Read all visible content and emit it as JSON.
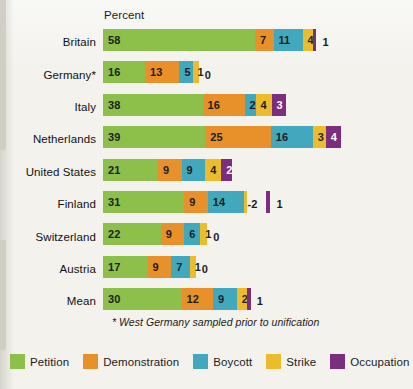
{
  "axis_title": "Percent",
  "footnote": "* West Germany sampled prior to unification",
  "colors": {
    "petition": "#8cc04a",
    "demonstration": "#e8912a",
    "boycott": "#42a8bd",
    "strike": "#ebbd2c",
    "occupation": "#7b2d7e",
    "background": "#f3f2ed",
    "text": "#1b1b1b"
  },
  "legend": [
    {
      "label": "Petition",
      "color": "#8cc04a",
      "key": "petition"
    },
    {
      "label": "Demonstration",
      "color": "#e8912a",
      "key": "demonstration"
    },
    {
      "label": "Boycott",
      "color": "#42a8bd",
      "key": "boycott"
    },
    {
      "label": "Strike",
      "color": "#ebbd2c",
      "key": "strike"
    },
    {
      "label": "Occupation",
      "color": "#7b2d7e",
      "key": "occupation"
    }
  ],
  "chart_data": {
    "type": "bar",
    "orientation": "horizontal",
    "stacked": true,
    "title": "",
    "xlabel": "Percent",
    "ylabel": "",
    "xlim": [
      0,
      90
    ],
    "grid": false,
    "legend_position": "bottom",
    "categories": [
      "Britain",
      "Germany*",
      "Italy",
      "Netherlands",
      "United States",
      "Finland",
      "Switzerland",
      "Austria",
      "Mean"
    ],
    "series": [
      {
        "name": "Petition",
        "color": "#8cc04a",
        "values": [
          58,
          16,
          38,
          39,
          21,
          31,
          22,
          17,
          30
        ]
      },
      {
        "name": "Demonstration",
        "color": "#e8912a",
        "values": [
          7,
          13,
          16,
          25,
          9,
          9,
          9,
          9,
          12
        ]
      },
      {
        "name": "Boycott",
        "color": "#42a8bd",
        "values": [
          11,
          5,
          2,
          16,
          9,
          14,
          6,
          7,
          9
        ]
      },
      {
        "name": "Strike",
        "color": "#ebbd2c",
        "values": [
          4,
          1,
          4,
          3,
          4,
          2,
          1,
          1,
          2
        ]
      },
      {
        "name": "Occupation",
        "color": "#7b2d7e",
        "values": [
          1,
          0,
          3,
          4,
          2,
          1,
          0,
          0,
          1
        ]
      }
    ],
    "annotations": [
      {
        "category": "Finland",
        "series": "Strike",
        "text": "-2",
        "style": "leader-dash"
      }
    ]
  },
  "rows": [
    {
      "label": "Britain",
      "segments": [
        {
          "key": "petition",
          "value": "58",
          "width": 152.0,
          "color": "#8cc04a",
          "label_inside": true
        },
        {
          "key": "demonstration",
          "value": "7",
          "width": 18.5,
          "color": "#e8912a",
          "label_inside": true
        },
        {
          "key": "boycott",
          "value": "11",
          "width": 29.0,
          "color": "#42a8bd",
          "label_inside": true
        },
        {
          "key": "strike",
          "value": "4",
          "width": 10.6,
          "color": "#ebbd2c",
          "label_inside": true
        },
        {
          "key": "occupation",
          "value": "1",
          "width": 3.4,
          "color": "#7b2d7e",
          "label_inside": false
        }
      ],
      "outer_value": "1"
    },
    {
      "label": "Germany*",
      "segments": [
        {
          "key": "petition",
          "value": "16",
          "width": 42.0,
          "color": "#8cc04a",
          "label_inside": true
        },
        {
          "key": "demonstration",
          "value": "13",
          "width": 34.4,
          "color": "#e8912a",
          "label_inside": true
        },
        {
          "key": "boycott",
          "value": "5",
          "width": 13.2,
          "color": "#42a8bd",
          "label_inside": true
        },
        {
          "key": "strike",
          "value": "1",
          "width": 6.2,
          "color": "#ebbd2c",
          "label_inside": true
        },
        {
          "key": "occupation",
          "value": "0",
          "width": 0,
          "color": "#7b2d7e",
          "label_inside": false
        }
      ],
      "outer_value": "0"
    },
    {
      "label": "Italy",
      "segments": [
        {
          "key": "petition",
          "value": "38",
          "width": 99.6,
          "color": "#8cc04a",
          "label_inside": true
        },
        {
          "key": "demonstration",
          "value": "16",
          "width": 42.0,
          "color": "#e8912a",
          "label_inside": true
        },
        {
          "key": "boycott",
          "value": "2",
          "width": 11.0,
          "color": "#42a8bd",
          "label_inside": true
        },
        {
          "key": "strike",
          "value": "4",
          "width": 16.0,
          "color": "#ebbd2c",
          "label_inside": true
        },
        {
          "key": "occupation",
          "value": "3",
          "width": 14.0,
          "color": "#7b2d7e",
          "label_inside": true
        }
      ],
      "outer_value": ""
    },
    {
      "label": "Netherlands",
      "segments": [
        {
          "key": "petition",
          "value": "39",
          "width": 102.2,
          "color": "#8cc04a",
          "label_inside": true
        },
        {
          "key": "demonstration",
          "value": "25",
          "width": 65.5,
          "color": "#e8912a",
          "label_inside": true
        },
        {
          "key": "boycott",
          "value": "16",
          "width": 42.0,
          "color": "#42a8bd",
          "label_inside": true
        },
        {
          "key": "strike",
          "value": "3",
          "width": 13.0,
          "color": "#ebbd2c",
          "label_inside": true
        },
        {
          "key": "occupation",
          "value": "4",
          "width": 15.5,
          "color": "#7b2d7e",
          "label_inside": true
        }
      ],
      "outer_value": ""
    },
    {
      "label": "United States",
      "segments": [
        {
          "key": "petition",
          "value": "21",
          "width": 55.0,
          "color": "#8cc04a",
          "label_inside": true
        },
        {
          "key": "demonstration",
          "value": "9",
          "width": 23.6,
          "color": "#e8912a",
          "label_inside": true
        },
        {
          "key": "boycott",
          "value": "9",
          "width": 23.6,
          "color": "#42a8bd",
          "label_inside": true
        },
        {
          "key": "strike",
          "value": "4",
          "width": 16.0,
          "color": "#ebbd2c",
          "label_inside": true
        },
        {
          "key": "occupation",
          "value": "2",
          "width": 11.0,
          "color": "#7b2d7e",
          "label_inside": true
        }
      ],
      "outer_value": ""
    },
    {
      "label": "Finland",
      "segments": [
        {
          "key": "petition",
          "value": "31",
          "width": 81.2,
          "color": "#8cc04a",
          "label_inside": true
        },
        {
          "key": "demonstration",
          "value": "9",
          "width": 23.6,
          "color": "#e8912a",
          "label_inside": true
        },
        {
          "key": "boycott",
          "value": "14",
          "width": 36.7,
          "color": "#42a8bd",
          "label_inside": true
        },
        {
          "key": "strike",
          "value": "2",
          "width": 3.0,
          "color": "#ebbd2c",
          "label_inside": false
        },
        {
          "key": "gap",
          "value": "",
          "width": 19.0,
          "color": "transparent",
          "label_inside": false
        },
        {
          "key": "occupation",
          "value": "1",
          "width": 4.0,
          "color": "#7b2d7e",
          "label_inside": false
        }
      ],
      "callout_value": "-2",
      "outer_value": "1"
    },
    {
      "label": "Switzerland",
      "segments": [
        {
          "key": "petition",
          "value": "22",
          "width": 57.7,
          "color": "#8cc04a",
          "label_inside": true
        },
        {
          "key": "demonstration",
          "value": "9",
          "width": 23.6,
          "color": "#e8912a",
          "label_inside": true
        },
        {
          "key": "boycott",
          "value": "6",
          "width": 16.0,
          "color": "#42a8bd",
          "label_inside": true
        },
        {
          "key": "strike",
          "value": "1",
          "width": 7.0,
          "color": "#ebbd2c",
          "label_inside": true
        },
        {
          "key": "occupation",
          "value": "0",
          "width": 0,
          "color": "#7b2d7e",
          "label_inside": false
        }
      ],
      "outer_value": "0"
    },
    {
      "label": "Austria",
      "segments": [
        {
          "key": "petition",
          "value": "17",
          "width": 44.6,
          "color": "#8cc04a",
          "label_inside": true
        },
        {
          "key": "demonstration",
          "value": "9",
          "width": 23.6,
          "color": "#e8912a",
          "label_inside": true
        },
        {
          "key": "boycott",
          "value": "7",
          "width": 18.5,
          "color": "#42a8bd",
          "label_inside": true
        },
        {
          "key": "strike",
          "value": "1",
          "width": 6.0,
          "color": "#ebbd2c",
          "label_inside": true
        },
        {
          "key": "occupation",
          "value": "0",
          "width": 0,
          "color": "#7b2d7e",
          "label_inside": false
        }
      ],
      "outer_value": "0"
    },
    {
      "label": "Mean",
      "segments": [
        {
          "key": "petition",
          "value": "30",
          "width": 78.6,
          "color": "#8cc04a",
          "label_inside": true
        },
        {
          "key": "demonstration",
          "value": "12",
          "width": 31.5,
          "color": "#e8912a",
          "label_inside": true
        },
        {
          "key": "boycott",
          "value": "9",
          "width": 23.6,
          "color": "#42a8bd",
          "label_inside": true
        },
        {
          "key": "strike",
          "value": "2",
          "width": 10.0,
          "color": "#ebbd2c",
          "label_inside": true
        },
        {
          "key": "occupation",
          "value": "1",
          "width": 4.0,
          "color": "#7b2d7e",
          "label_inside": false
        }
      ],
      "outer_value": "1"
    }
  ]
}
